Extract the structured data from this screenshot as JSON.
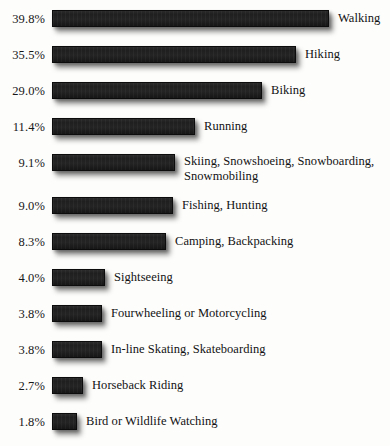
{
  "chart_data": {
    "type": "bar",
    "orientation": "horizontal",
    "title": "",
    "subtitle": "",
    "xlabel": "",
    "ylabel": "",
    "grid": false,
    "legend": false,
    "value_suffix": "%",
    "categories": [
      "Walking",
      "Hiking",
      "Biking",
      "Running",
      "Skiing, Snowshoeing, Snowboarding,\nSnowmobiling",
      "Fishing, Hunting",
      "Camping, Backpacking",
      "Sightseeing",
      "Fourwheeling or Motorcycling",
      "In-line Skating, Skateboarding",
      "Horseback Riding",
      "Bird or Wildlife Watching"
    ],
    "values": [
      39.8,
      35.5,
      29.0,
      11.4,
      9.1,
      9.0,
      8.3,
      4.0,
      3.8,
      3.8,
      2.7,
      1.8
    ],
    "value_labels": [
      "39.8%",
      "35.5%",
      "29.0%",
      "11.4%",
      "9.1%",
      "9.0%",
      "8.3%",
      "4.0%",
      "3.8%",
      "3.8%",
      "2.7%",
      "1.8%"
    ],
    "bar_pixel_widths": [
      277,
      244,
      210,
      143,
      123,
      121,
      114,
      53,
      50,
      50,
      31,
      25
    ],
    "bar_color": "#1f1f1f",
    "background_color": "#fdfdfc",
    "text_color": "#121212"
  },
  "rows": [
    {
      "pct": "39.8%",
      "label": "Walking",
      "width": 277,
      "top": 10,
      "wrap": false
    },
    {
      "pct": "35.5%",
      "label": "Hiking",
      "width": 244,
      "top": 46,
      "wrap": false
    },
    {
      "pct": "29.0%",
      "label": "Biking",
      "width": 210,
      "top": 82,
      "wrap": false
    },
    {
      "pct": "11.4%",
      "label": "Running",
      "width": 143,
      "top": 118,
      "wrap": false
    },
    {
      "pct": "9.1%",
      "label": "Skiing, Snowshoeing, Snowboarding,\nSnowmobiling",
      "width": 123,
      "top": 154,
      "wrap": true
    },
    {
      "pct": "9.0%",
      "label": "Fishing, Hunting",
      "width": 121,
      "top": 197,
      "wrap": false
    },
    {
      "pct": "8.3%",
      "label": "Camping, Backpacking",
      "width": 114,
      "top": 233,
      "wrap": false
    },
    {
      "pct": "4.0%",
      "label": "Sightseeing",
      "width": 53,
      "top": 269,
      "wrap": false
    },
    {
      "pct": "3.8%",
      "label": "Fourwheeling or Motorcycling",
      "width": 50,
      "top": 305,
      "wrap": false
    },
    {
      "pct": "3.8%",
      "label": "In-line Skating, Skateboarding",
      "width": 50,
      "top": 341,
      "wrap": false
    },
    {
      "pct": "2.7%",
      "label": "Horseback Riding",
      "width": 31,
      "top": 377,
      "wrap": false
    },
    {
      "pct": "1.8%",
      "label": "Bird or Wildlife Watching",
      "width": 25,
      "top": 413,
      "wrap": false
    }
  ]
}
